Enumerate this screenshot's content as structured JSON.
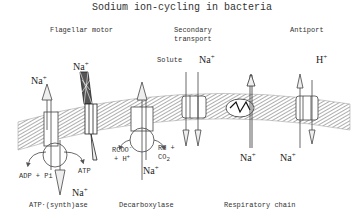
{
  "title": "Sodium ion-cycling in bacteria",
  "labels": {
    "flagellar_motor": "Flagellar motor",
    "secondary_transport_1": "Secondary",
    "secondary_transport_2": "transport",
    "antiport": "Antiport",
    "solute": "Solute",
    "atp_synthase": "ATP·(synth)ase",
    "decarboxylase": "Decarboxylase",
    "respiratory_chain": "Respiratory chain",
    "adp_pi": "ADP + Pi",
    "atp": "ATP",
    "rcoo": "RCOO",
    "rcoo_sup": "-",
    "plus_h": "+ H",
    "plus_h_sup": "+",
    "rh": "RH +",
    "co2": "CO",
    "co2_sub": "2"
  },
  "ions": {
    "na": "Na",
    "h": "H",
    "plus": "+"
  },
  "colors": {
    "line": "#444444",
    "membrane_hatch": "#888888",
    "background": "#ffffff"
  }
}
